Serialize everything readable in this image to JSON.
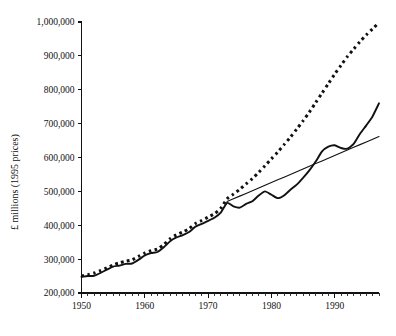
{
  "chart_data": {
    "type": "line",
    "title": "",
    "subtitle": "",
    "xlabel": "",
    "ylabel": "£ millions (1995 prices)",
    "xlim": [
      1950,
      1997
    ],
    "ylim": [
      200000,
      1000000
    ],
    "grid": false,
    "legend_position": "none",
    "y_ticks": [
      200000,
      300000,
      400000,
      500000,
      600000,
      700000,
      800000,
      900000,
      1000000
    ],
    "y_tick_labels": [
      "200,000",
      "300,000",
      "400,000",
      "500,000",
      "600,000",
      "700,000",
      "800,000",
      "900,000",
      "1,000,000"
    ],
    "x_ticks": [
      1950,
      1960,
      1970,
      1980,
      1990
    ],
    "x_tick_labels": [
      "1950",
      "1960",
      "1970",
      "1980",
      "1990"
    ],
    "x_minor_tick_step": 1,
    "x": [
      1950,
      1951,
      1952,
      1953,
      1954,
      1955,
      1956,
      1957,
      1958,
      1959,
      1960,
      1961,
      1962,
      1963,
      1964,
      1965,
      1966,
      1967,
      1968,
      1969,
      1970,
      1971,
      1972,
      1973,
      1974,
      1975,
      1976,
      1977,
      1978,
      1979,
      1980,
      1981,
      1982,
      1983,
      1984,
      1985,
      1986,
      1987,
      1988,
      1989,
      1990,
      1991,
      1992,
      1993,
      1994,
      1995,
      1996,
      1997
    ],
    "series": [
      {
        "name": "actual",
        "style": "solid-thick",
        "values": [
          248000,
          250000,
          251000,
          259000,
          269000,
          278000,
          281000,
          286000,
          287000,
          298000,
          311000,
          318000,
          321000,
          335000,
          353000,
          364000,
          371000,
          380000,
          396000,
          404000,
          413000,
          422000,
          437000,
          466000,
          456000,
          452000,
          463000,
          471000,
          488000,
          500000,
          490000,
          480000,
          488000,
          505000,
          520000,
          540000,
          562000,
          588000,
          618000,
          632000,
          636000,
          628000,
          626000,
          640000,
          670000,
          695000,
          722000,
          760000
        ]
      },
      {
        "name": "trend",
        "style": "solid-thin",
        "values": [
          null,
          null,
          null,
          null,
          null,
          null,
          null,
          null,
          null,
          null,
          null,
          null,
          null,
          null,
          null,
          null,
          null,
          null,
          null,
          null,
          null,
          null,
          null,
          470000,
          478000,
          486000,
          494000,
          502000,
          510000,
          518000,
          526000,
          534000,
          542000,
          550000,
          558000,
          566000,
          574000,
          582000,
          590000,
          598000,
          606000,
          614000,
          622000,
          630000,
          638000,
          646000,
          654000,
          662000
        ]
      },
      {
        "name": "counterfactual",
        "style": "dotted",
        "values": [
          250000,
          254000,
          259000,
          266000,
          274000,
          283000,
          289000,
          294000,
          298000,
          308000,
          318000,
          325000,
          330000,
          343000,
          360000,
          372000,
          380000,
          390000,
          405000,
          414000,
          424000,
          434000,
          450000,
          478000,
          492000,
          506000,
          522000,
          538000,
          556000,
          576000,
          596000,
          616000,
          638000,
          660000,
          684000,
          708000,
          734000,
          762000,
          790000,
          818000,
          846000,
          872000,
          898000,
          920000,
          942000,
          962000,
          980000,
          998000
        ]
      }
    ]
  },
  "axis": {
    "y_title": "£ millions (1995 prices)"
  }
}
